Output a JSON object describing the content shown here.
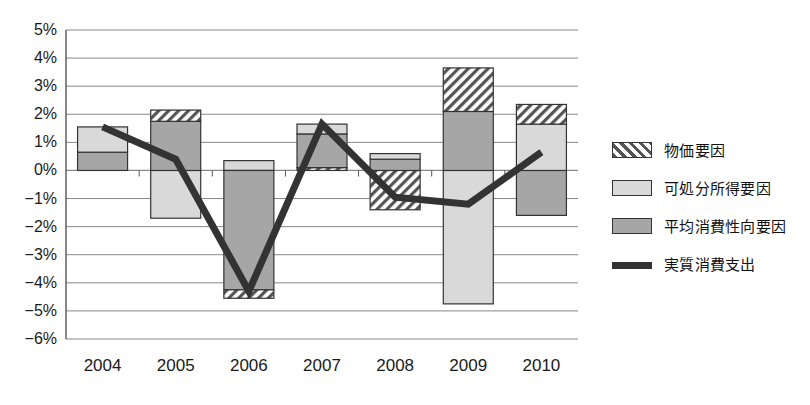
{
  "chart_data": {
    "type": "bar",
    "subtype": "stacked-bar-with-line",
    "title": "",
    "xlabel": "",
    "ylabel": "",
    "categories": [
      "2004",
      "2005",
      "2006",
      "2007",
      "2008",
      "2009",
      "2010"
    ],
    "ytick_labels": [
      "5%",
      "4%",
      "3%",
      "2%",
      "1%",
      "0%",
      "−1%",
      "−2%",
      "−3%",
      "−4%",
      "−5%",
      "−6%"
    ],
    "ytick_values": [
      5,
      4,
      3,
      2,
      1,
      0,
      -1,
      -2,
      -3,
      -4,
      -5,
      -6
    ],
    "ylim": [
      -6,
      5
    ],
    "grid": true,
    "legend_position": "right",
    "series": [
      {
        "name": "物価要因",
        "key": "price",
        "kind": "bar",
        "fill": "hatch",
        "values": [
          0.0,
          0.4,
          -0.3,
          0.1,
          0.0,
          1.55,
          0.7
        ]
      },
      {
        "name": "可処分所得要因",
        "key": "disposable_income",
        "kind": "bar",
        "fill": "light",
        "values": [
          0.9,
          -1.7,
          0.35,
          0.35,
          0.2,
          -4.75,
          1.65
        ]
      },
      {
        "name": "平均消費性向要因",
        "key": "propensity",
        "kind": "bar",
        "fill": "medium",
        "values": [
          0.65,
          1.75,
          -4.25,
          1.2,
          0.4,
          2.1,
          -1.6
        ]
      },
      {
        "name": "実質消費支出",
        "key": "real_consumption",
        "kind": "line",
        "fill": "dark-line",
        "values": [
          1.55,
          0.4,
          -4.3,
          1.65,
          -0.95,
          -1.2,
          0.65
        ]
      }
    ],
    "stack_segments": {
      "2004": [
        {
          "key": "propensity",
          "from": 0.0,
          "to": 0.65
        },
        {
          "key": "disposable_income",
          "from": 0.65,
          "to": 1.55
        }
      ],
      "2005": [
        {
          "key": "disposable_income",
          "from": 0.0,
          "to": -1.7
        },
        {
          "key": "propensity",
          "from": 0.0,
          "to": 1.75
        },
        {
          "key": "price",
          "from": 1.75,
          "to": 2.15
        }
      ],
      "2006": [
        {
          "key": "disposable_income",
          "from": 0.0,
          "to": 0.35
        },
        {
          "key": "propensity",
          "from": 0.0,
          "to": -4.25
        },
        {
          "key": "price",
          "from": -4.25,
          "to": -4.55
        }
      ],
      "2007": [
        {
          "key": "price",
          "from": 0.0,
          "to": 0.1
        },
        {
          "key": "propensity",
          "from": 0.1,
          "to": 1.3
        },
        {
          "key": "disposable_income",
          "from": 1.3,
          "to": 1.65
        }
      ],
      "2008": [
        {
          "key": "price",
          "from": 0.0,
          "to": -1.4
        },
        {
          "key": "propensity",
          "from": 0.0,
          "to": 0.4
        },
        {
          "key": "disposable_income",
          "from": 0.4,
          "to": 0.6
        }
      ],
      "2009": [
        {
          "key": "disposable_income",
          "from": 0.0,
          "to": -4.75
        },
        {
          "key": "propensity",
          "from": 0.0,
          "to": 2.1
        },
        {
          "key": "price",
          "from": 2.1,
          "to": 3.65
        }
      ],
      "2010": [
        {
          "key": "propensity",
          "from": 0.0,
          "to": -1.6
        },
        {
          "key": "disposable_income",
          "from": 0.0,
          "to": 1.65
        },
        {
          "key": "price",
          "from": 1.65,
          "to": 2.35
        }
      ]
    }
  },
  "legend": {
    "items": [
      {
        "label": "物価要因",
        "style": "hatch"
      },
      {
        "label": "可処分所得要因",
        "style": "light"
      },
      {
        "label": "平均消費性向要因",
        "style": "medium"
      },
      {
        "label": "実質消費支出",
        "style": "line"
      }
    ]
  },
  "colors": {
    "light": "#d9d9d9",
    "medium": "#a6a6a6",
    "hatch_bg": "#ffffff",
    "hatch_stroke": "#555555",
    "line": "#333333",
    "grid": "#888888",
    "axis": "#555555",
    "text": "#1a1a1a",
    "border": "#333333"
  }
}
